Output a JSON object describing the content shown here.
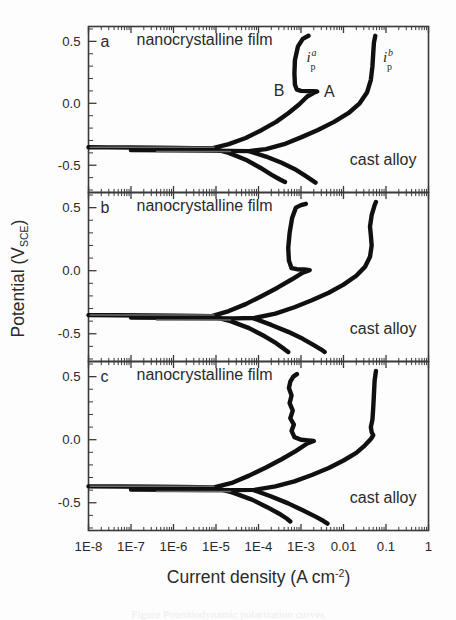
{
  "figure": {
    "background": "#fdfdfd",
    "ink": "#101010"
  },
  "axes": {
    "y_title_main": "Potential (V",
    "y_title_sub": "SCE",
    "y_title_close": ")",
    "x_title_main": "Current density (A cm",
    "x_title_sup": "-2",
    "x_title_close": ")",
    "y_ticks": [
      "0.5",
      "0.0",
      "-0.5"
    ],
    "x_ticks": [
      "1E-8",
      "1E-7",
      "1E-6",
      "1E-5",
      "1E-4",
      "1E-3",
      "0.01",
      "0.1",
      "1"
    ]
  },
  "panels": [
    {
      "letter": "a",
      "labels": {
        "film": "nanocrystalline film",
        "cast": "cast alloy",
        "point_a": "A",
        "point_b": "B",
        "ip_a_sym": "i",
        "ip_a_sup": "a",
        "ip_a_sub": "p",
        "ip_b_sym": "i",
        "ip_b_sup": "b",
        "ip_b_sub": "p"
      }
    },
    {
      "letter": "b",
      "labels": {
        "film": "nanocrystalline film",
        "cast": "cast alloy"
      }
    },
    {
      "letter": "c",
      "labels": {
        "film": "nanocrystalline film",
        "cast": "cast alloy"
      }
    }
  ],
  "caption": "Figure  Potentiodynamic polarization curves",
  "chart_data": {
    "type": "line",
    "title": "",
    "xlabel": "Current density (A cm^-2)",
    "ylabel": "Potential (V_SCE)",
    "xscale": "log",
    "xlim": [
      1e-08,
      1
    ],
    "ylim": [
      -0.72,
      0.62
    ],
    "grid": false,
    "legend": "in-plot annotations",
    "x_tick_values": [
      1e-08,
      1e-07,
      1e-06,
      1e-05,
      0.0001,
      0.001,
      0.01,
      0.1,
      1
    ],
    "x_tick_labels": [
      "1E-8",
      "1E-7",
      "1E-6",
      "1E-5",
      "1E-4",
      "1E-3",
      "0.01",
      "0.1",
      "1"
    ],
    "y_tick_values": [
      0.5,
      0.0,
      -0.5
    ],
    "y_tick_labels": [
      "0.5",
      "0.0",
      "-0.5"
    ],
    "panels": [
      {
        "panel": "a",
        "series": [
          {
            "name": "nanocrystalline film",
            "annotation": "i_p^a passive current at B",
            "points": [
              [
                1e-08,
                -0.355
              ],
              [
                3e-08,
                -0.356
              ],
              [
                1e-07,
                -0.357
              ],
              [
                4e-07,
                -0.358
              ],
              [
                1.2e-06,
                -0.36
              ],
              [
                3e-06,
                -0.362
              ],
              [
                8e-06,
                -0.363
              ],
              [
                2e-05,
                -0.33
              ],
              [
                5e-05,
                -0.28
              ],
              [
                0.00012,
                -0.215
              ],
              [
                0.00026,
                -0.15
              ],
              [
                0.0005,
                -0.08
              ],
              [
                0.0009,
                -0.01
              ],
              [
                0.0014,
                0.055
              ],
              [
                0.002,
                0.085
              ],
              [
                0.0024,
                0.095
              ],
              [
                0.002,
                0.097
              ],
              [
                0.0014,
                0.098
              ],
              [
                0.001,
                0.1
              ],
              [
                0.0008,
                0.11
              ],
              [
                0.00072,
                0.15
              ],
              [
                0.0007,
                0.24
              ],
              [
                0.00072,
                0.35
              ],
              [
                0.00085,
                0.46
              ],
              [
                0.0011,
                0.52
              ],
              [
                0.0015,
                0.545
              ]
            ]
          },
          {
            "name": "nanocrystalline film cathodic",
            "points": [
              [
                8e-06,
                -0.364
              ],
              [
                2e-05,
                -0.4
              ],
              [
                5e-05,
                -0.455
              ],
              [
                0.00011,
                -0.52
              ],
              [
                0.0002,
                -0.575
              ],
              [
                0.00032,
                -0.615
              ],
              [
                0.00042,
                -0.635
              ]
            ]
          },
          {
            "name": "cast alloy",
            "annotation": "i_p^b",
            "points": [
              [
                1e-07,
                -0.378
              ],
              [
                1e-06,
                -0.38
              ],
              [
                5e-06,
                -0.382
              ],
              [
                2e-05,
                -0.384
              ],
              [
                6e-05,
                -0.386
              ],
              [
                0.00015,
                -0.37
              ],
              [
                0.0004,
                -0.33
              ],
              [
                0.001,
                -0.275
              ],
              [
                0.0025,
                -0.215
              ],
              [
                0.006,
                -0.15
              ],
              [
                0.013,
                -0.08
              ],
              [
                0.024,
                0.0
              ],
              [
                0.036,
                0.09
              ],
              [
                0.044,
                0.19
              ],
              [
                0.048,
                0.3
              ],
              [
                0.05,
                0.4
              ],
              [
                0.052,
                0.49
              ],
              [
                0.056,
                0.545
              ]
            ]
          },
          {
            "name": "cast alloy cathodic",
            "points": [
              [
                6e-05,
                -0.387
              ],
              [
                0.00015,
                -0.43
              ],
              [
                0.00035,
                -0.48
              ],
              [
                0.0007,
                -0.53
              ],
              [
                0.0012,
                -0.58
              ],
              [
                0.0018,
                -0.62
              ],
              [
                0.0022,
                -0.64
              ]
            ]
          }
        ]
      },
      {
        "panel": "b",
        "series": [
          {
            "name": "nanocrystalline film",
            "points": [
              [
                1e-08,
                -0.352
              ],
              [
                5e-08,
                -0.353
              ],
              [
                3e-07,
                -0.355
              ],
              [
                1.2e-06,
                -0.357
              ],
              [
                3.5e-06,
                -0.359
              ],
              [
                8e-06,
                -0.361
              ],
              [
                2e-05,
                -0.32
              ],
              [
                5e-05,
                -0.265
              ],
              [
                0.00012,
                -0.2
              ],
              [
                0.00028,
                -0.135
              ],
              [
                0.0006,
                -0.07
              ],
              [
                0.0011,
                -0.015
              ],
              [
                0.0016,
                0.005
              ],
              [
                0.0012,
                0.01
              ],
              [
                0.0008,
                0.012
              ],
              [
                0.0006,
                0.02
              ],
              [
                0.00052,
                0.08
              ],
              [
                0.0005,
                0.18
              ],
              [
                0.00054,
                0.3
              ],
              [
                0.00062,
                0.42
              ],
              [
                0.00076,
                0.5
              ],
              [
                0.001,
                0.52
              ],
              [
                0.0013,
                0.53
              ]
            ]
          },
          {
            "name": "nanocrystalline film cathodic",
            "points": [
              [
                8e-06,
                -0.362
              ],
              [
                2.2e-05,
                -0.4
              ],
              [
                6e-05,
                -0.455
              ],
              [
                0.00014,
                -0.52
              ],
              [
                0.00026,
                -0.575
              ],
              [
                0.0004,
                -0.62
              ],
              [
                0.0005,
                -0.645
              ]
            ]
          },
          {
            "name": "cast alloy",
            "points": [
              [
                1e-07,
                -0.372
              ],
              [
                1e-06,
                -0.374
              ],
              [
                6e-06,
                -0.376
              ],
              [
                2.5e-05,
                -0.378
              ],
              [
                8e-05,
                -0.375
              ],
              [
                0.00025,
                -0.34
              ],
              [
                0.0007,
                -0.29
              ],
              [
                0.0018,
                -0.235
              ],
              [
                0.0045,
                -0.175
              ],
              [
                0.01,
                -0.11
              ],
              [
                0.02,
                -0.04
              ],
              [
                0.032,
                0.03
              ],
              [
                0.042,
                0.11
              ],
              [
                0.046,
                0.2
              ],
              [
                0.044,
                0.28
              ],
              [
                0.042,
                0.35
              ],
              [
                0.046,
                0.44
              ],
              [
                0.054,
                0.52
              ],
              [
                0.058,
                0.545
              ]
            ]
          },
          {
            "name": "cast alloy cathodic",
            "points": [
              [
                8e-05,
                -0.38
              ],
              [
                0.0002,
                -0.43
              ],
              [
                0.0005,
                -0.485
              ],
              [
                0.0011,
                -0.54
              ],
              [
                0.002,
                -0.59
              ],
              [
                0.003,
                -0.625
              ],
              [
                0.0036,
                -0.645
              ]
            ]
          }
        ]
      },
      {
        "panel": "c",
        "series": [
          {
            "name": "nanocrystalline film",
            "points": [
              [
                1e-08,
                -0.37
              ],
              [
                6e-08,
                -0.371
              ],
              [
                4e-07,
                -0.373
              ],
              [
                1.5e-06,
                -0.375
              ],
              [
                4e-06,
                -0.377
              ],
              [
                9e-06,
                -0.379
              ],
              [
                2.5e-05,
                -0.34
              ],
              [
                6e-05,
                -0.285
              ],
              [
                0.00015,
                -0.22
              ],
              [
                0.00035,
                -0.155
              ],
              [
                0.00075,
                -0.09
              ],
              [
                0.0014,
                -0.03
              ],
              [
                0.002,
                -0.01
              ],
              [
                0.0015,
                -0.005
              ],
              [
                0.001,
                0.0
              ],
              [
                0.0007,
                0.02
              ],
              [
                0.0006,
                0.07
              ],
              [
                0.00068,
                0.12
              ],
              [
                0.00056,
                0.17
              ],
              [
                0.00064,
                0.23
              ],
              [
                0.00054,
                0.29
              ],
              [
                0.0006,
                0.35
              ],
              [
                0.00052,
                0.41
              ],
              [
                0.00056,
                0.46
              ],
              [
                0.00066,
                0.5
              ],
              [
                0.0008,
                0.52
              ]
            ]
          },
          {
            "name": "nanocrystalline film cathodic",
            "points": [
              [
                9e-06,
                -0.38
              ],
              [
                2.5e-05,
                -0.42
              ],
              [
                7e-05,
                -0.475
              ],
              [
                0.00016,
                -0.535
              ],
              [
                0.0003,
                -0.585
              ],
              [
                0.00046,
                -0.625
              ],
              [
                0.00056,
                -0.648
              ]
            ]
          },
          {
            "name": "cast alloy",
            "points": [
              [
                1e-07,
                -0.395
              ],
              [
                1e-06,
                -0.397
              ],
              [
                6e-06,
                -0.399
              ],
              [
                2.5e-05,
                -0.4
              ],
              [
                8e-05,
                -0.398
              ],
              [
                0.00025,
                -0.37
              ],
              [
                0.0007,
                -0.33
              ],
              [
                0.0018,
                -0.28
              ],
              [
                0.0045,
                -0.225
              ],
              [
                0.01,
                -0.165
              ],
              [
                0.02,
                -0.105
              ],
              [
                0.032,
                -0.045
              ],
              [
                0.044,
                0.005
              ],
              [
                0.05,
                0.035
              ],
              [
                0.046,
                0.06
              ],
              [
                0.044,
                0.1
              ],
              [
                0.048,
                0.16
              ],
              [
                0.05,
                0.25
              ],
              [
                0.052,
                0.36
              ],
              [
                0.054,
                0.47
              ],
              [
                0.058,
                0.545
              ]
            ]
          },
          {
            "name": "cast alloy cathodic",
            "points": [
              [
                8e-05,
                -0.402
              ],
              [
                0.0002,
                -0.45
              ],
              [
                0.0005,
                -0.505
              ],
              [
                0.0011,
                -0.56
              ],
              [
                0.0022,
                -0.61
              ],
              [
                0.0034,
                -0.645
              ],
              [
                0.0042,
                -0.665
              ]
            ]
          }
        ]
      }
    ]
  }
}
